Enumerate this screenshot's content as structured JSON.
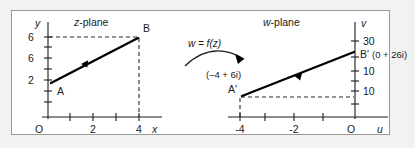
{
  "figure": {
    "background_color": "#ffffff",
    "page_color": "#f2f2f0",
    "border_color": "#9a9a9a",
    "ink_color": "#1a1a1a"
  },
  "mapping": {
    "label": "w = f(z)",
    "arrow_name": "transformation-arrow"
  },
  "left_panel": {
    "title_italic": "z",
    "title_rest": "-plane",
    "vertical_axis_label": "y",
    "horizontal_axis_label": "x",
    "origin_label": "O",
    "y_tick_labels": [
      "6",
      "6",
      "2"
    ],
    "x_tick_labels": [
      "2",
      "4"
    ],
    "points": [
      {
        "name": "A",
        "label": "A"
      },
      {
        "name": "B",
        "label": "B"
      }
    ]
  },
  "right_panel": {
    "title_italic": "w",
    "title_rest": "-plane",
    "vertical_axis_label": "v",
    "horizontal_axis_label": "u",
    "origin_label": "O",
    "v_tick_labels": [
      "30",
      "10",
      "10"
    ],
    "u_tick_labels": [
      "-4",
      "-2"
    ],
    "points": [
      {
        "name": "A-prime",
        "label": "A'",
        "coordinate": "(–4 + 6i)"
      },
      {
        "name": "B-prime",
        "label": "B'",
        "coordinate": "(0 + 26i)"
      }
    ]
  }
}
